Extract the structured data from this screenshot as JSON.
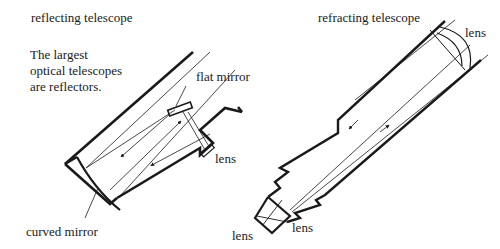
{
  "diagram": {
    "reflecting": {
      "title": "reflecting telescope",
      "note_lines": [
        "The largest",
        "optical telescopes",
        "are reflectors."
      ],
      "labels": {
        "flat_mirror": "flat mirror",
        "lens": "lens",
        "curved_mirror": "curved mirror"
      }
    },
    "refracting": {
      "title": "refracting telescope",
      "labels": {
        "objective_lens": "lens",
        "eyepiece_lens_left": "lens",
        "eyepiece_lens_right": "lens"
      }
    },
    "colors": {
      "ink": "#1a1a1a",
      "background": "#ffffff"
    }
  }
}
